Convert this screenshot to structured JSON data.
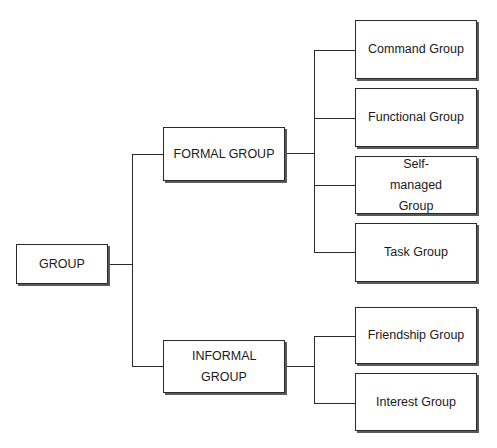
{
  "diagram": {
    "type": "hierarchy-tree",
    "root": {
      "label": "GROUP"
    },
    "branches": [
      {
        "label": "FORMAL GROUP",
        "children": [
          {
            "label": "Command Group"
          },
          {
            "label": "Functional Group"
          },
          {
            "label": "Self-managed Group"
          },
          {
            "label": "Task Group"
          }
        ]
      },
      {
        "label": "INFORMAL GROUP",
        "children": [
          {
            "label": "Friendship Group"
          },
          {
            "label": "Interest Group"
          }
        ]
      }
    ],
    "colors": {
      "line": "#2a2a2a",
      "box_fill": "#ffffff",
      "shadow": "#5a5a5a",
      "text": "#1a1a1a"
    }
  }
}
